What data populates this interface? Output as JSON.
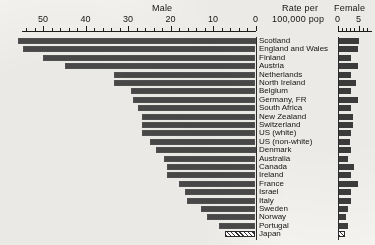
{
  "chart_data": {
    "type": "bar",
    "title": "",
    "subtitle": "",
    "unit_label_line1": "Rate per",
    "unit_label_line2": "100,000 pop",
    "panels": [
      {
        "name": "Male",
        "label": "Male",
        "xlabel": "",
        "direction": "right-to-left",
        "ticks": [
          50,
          40,
          30,
          20,
          10,
          0
        ],
        "tick_labels": [
          "50",
          "40",
          "30",
          "20",
          "10",
          "0"
        ],
        "xlim": [
          0,
          56
        ],
        "grid": false
      },
      {
        "name": "Female",
        "label": "Female",
        "xlabel": "",
        "direction": "left-to-right",
        "ticks": [
          0,
          5
        ],
        "tick_labels": [
          "0",
          "5"
        ],
        "xlim": [
          0,
          7
        ],
        "grid": false
      }
    ],
    "categories": [
      "Scotland",
      "England and Wales",
      "Finland",
      "Austria",
      "Netherlands",
      "North Ireland",
      "Belgium",
      "Germany, FR",
      "South Africa",
      "New Zealand",
      "Switzerland",
      "US (white)",
      "US (non-white)",
      "Denmark",
      "Australia",
      "Canada",
      "Ireland",
      "France",
      "Israel",
      "Italy",
      "Sweden",
      "Norway",
      "Portugal",
      "Japan"
    ],
    "series": [
      {
        "name": "Male",
        "values": [
          56.0,
          54.6,
          50.1,
          44.9,
          33.4,
          33.4,
          29.4,
          28.9,
          27.7,
          26.6,
          26.6,
          26.6,
          24.9,
          23.5,
          21.6,
          20.8,
          20.8,
          17.9,
          16.7,
          16.2,
          12.9,
          11.3,
          8.7,
          7.1
        ]
      },
      {
        "name": "Female",
        "values": [
          5.0,
          4.8,
          3.3,
          4.8,
          3.3,
          4.5,
          3.1,
          4.8,
          3.3,
          3.6,
          3.6,
          3.3,
          2.9,
          3.1,
          2.4,
          4.0,
          3.1,
          4.8,
          3.3,
          3.1,
          2.6,
          2.1,
          2.4,
          1.7
        ]
      }
    ],
    "highlight": {
      "category": "Japan",
      "style": "hatched",
      "note": "Japan bars drawn with diagonal hatch fill"
    },
    "colors": {
      "bar": "#4a4a4a",
      "background": "#f4f2ee",
      "axis": "#1d1d1d",
      "text": "#141414"
    }
  }
}
